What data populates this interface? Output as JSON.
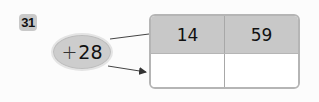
{
  "problem": {
    "number": "31",
    "operation": {
      "symbol": "+",
      "value": "28"
    },
    "table": {
      "inputs": [
        "14",
        "59"
      ],
      "outputs": [
        "",
        ""
      ]
    }
  },
  "colors": {
    "header_fill": "#c8c8c8",
    "oval_fill": "#cdcdcd",
    "border": "#b5b5b5"
  }
}
